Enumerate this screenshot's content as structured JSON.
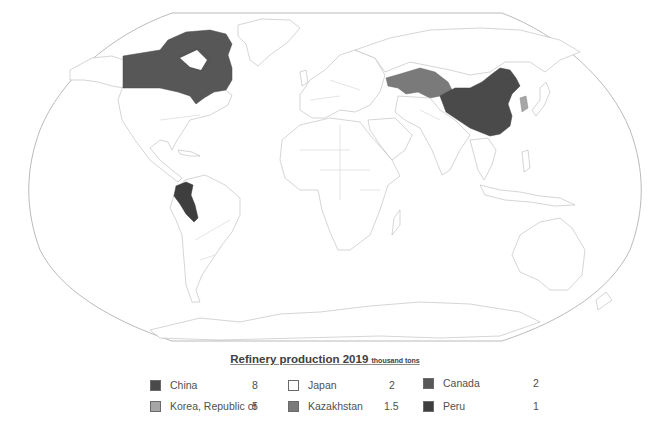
{
  "legend": {
    "title": "Refinery production 2019",
    "unit": "thousand tons",
    "items": [
      {
        "name": "China",
        "value": "8",
        "color": "#4a4a4a"
      },
      {
        "name": "Korea, Republic of",
        "value": "5",
        "color": "#a6a6a6"
      },
      {
        "name": "Japan",
        "value": "2",
        "color": "#ffffff"
      },
      {
        "name": "Kazakhstan",
        "value": "1.5",
        "color": "#7a7a7a"
      },
      {
        "name": "Canada",
        "value": "2",
        "color": "#575757"
      },
      {
        "name": "Peru",
        "value": "1",
        "color": "#3e3e3e"
      }
    ]
  },
  "map": {
    "projection": "Robinson",
    "highlighted_countries": [
      "China",
      "Korea, Republic of",
      "Japan",
      "Kazakhstan",
      "Canada",
      "Peru"
    ]
  }
}
